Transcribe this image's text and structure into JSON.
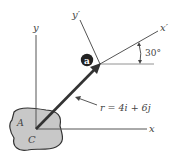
{
  "diagram": {
    "axes": {
      "x_label": "x",
      "y_label": "y",
      "x_prime_label": "x′",
      "y_prime_label": "y′"
    },
    "angle_label": "30°",
    "point_label": "a",
    "body_label": "A",
    "origin_label": "C",
    "vector_label": "r = 4i + 6j",
    "colors": {
      "body_fill": "#c8c8c8",
      "line": "#444444",
      "vector": "#333333",
      "point": "#222222"
    }
  }
}
